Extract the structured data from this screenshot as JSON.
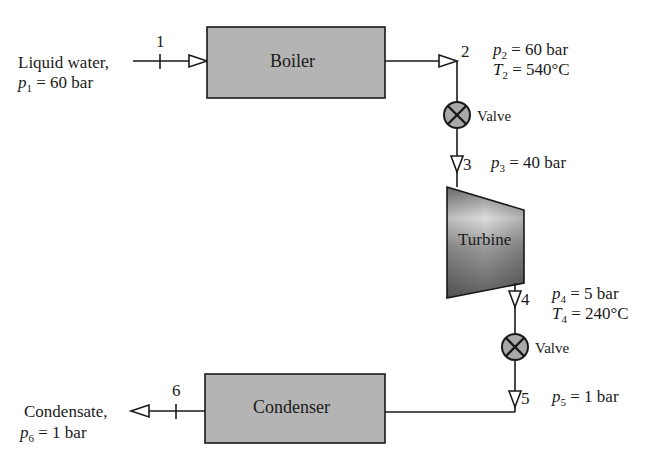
{
  "diagram": {
    "type": "flow-schematic",
    "components": {
      "boiler": {
        "label": "Boiler"
      },
      "turbine": {
        "label": "Turbine"
      },
      "condenser": {
        "label": "Condenser"
      },
      "valve_1": {
        "label": "Valve"
      },
      "valve_2": {
        "label": "Valve"
      }
    },
    "inlet": {
      "description": "Liquid water,",
      "state_label": "1",
      "var": "p",
      "sub": "1",
      "value": "= 60 bar"
    },
    "outlet": {
      "description": "Condensate,",
      "state_label": "6",
      "var": "p",
      "sub": "6",
      "value": "= 1 bar"
    },
    "states": {
      "s2": {
        "label": "2",
        "p_var": "p",
        "p_sub": "2",
        "p_value": "= 60 bar",
        "t_var": "T",
        "t_sub": "2",
        "t_value": "= 540°C"
      },
      "s3": {
        "label": "3",
        "p_var": "p",
        "p_sub": "3",
        "p_value": "= 40 bar"
      },
      "s4": {
        "label": "4",
        "p_var": "p",
        "p_sub": "4",
        "p_value": "= 5 bar",
        "t_var": "T",
        "t_sub": "4",
        "t_value": "= 240°C"
      },
      "s5": {
        "label": "5",
        "p_var": "p",
        "p_sub": "5",
        "p_value": "= 1 bar"
      }
    },
    "colors": {
      "box_fill": "#b4b4b4",
      "valve_fill": "#a9a9a9",
      "line": "#1a1a1a",
      "turbine_light": "#d9d9d9",
      "turbine_dark": "#6e6e6e"
    }
  }
}
